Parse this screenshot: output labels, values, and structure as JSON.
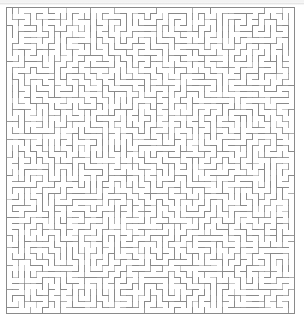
{
  "document": {
    "kind": "maze-puzzle",
    "title": "Rectangular Maze",
    "background_color": "#ffffff",
    "page_width": 304,
    "page_height": 321
  },
  "artifact": {
    "label": "scan-line",
    "color": "#aaaaaa",
    "top": 2,
    "height": 3
  },
  "maze": {
    "label": "maze-grid",
    "columns": 48,
    "rows": 51,
    "cell_size": 6,
    "origin_x": 6,
    "origin_y": 7,
    "width": 288,
    "height": 306,
    "wall_color": "#8a8a8a",
    "wall_thickness": 1,
    "border_color": "#8a8a8a",
    "border_thickness": 1,
    "passage_color": "#ffffff",
    "seed": 20240517,
    "entrance": {
      "side": "none",
      "index": -1
    },
    "exit": {
      "side": "none",
      "index": -1
    },
    "perfect": true
  }
}
